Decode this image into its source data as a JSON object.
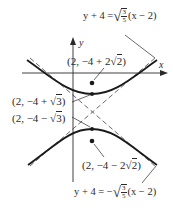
{
  "figure": {
    "type": "hyperbola-graph",
    "axes": {
      "x_label": "x",
      "y_label": "y"
    },
    "equations": {
      "upper_asymptote": {
        "lhs": "y + 4 = ",
        "sqrt": "√",
        "num": "3",
        "den": "5",
        "rhs": "(x − 2)"
      },
      "lower_asymptote": {
        "lhs": "y + 4 = −",
        "sqrt": "√",
        "num": "3",
        "den": "5",
        "rhs": "(x − 2)"
      }
    },
    "points": {
      "upper_focus": {
        "prefix": "(2, −4 + 2",
        "radical": "√",
        "radicand": "2",
        "suffix": ")"
      },
      "upper_vertex": {
        "prefix": "(2, −4 + ",
        "radical": "√",
        "radicand": "3",
        "suffix": ")"
      },
      "lower_vertex": {
        "prefix": "(2, −4 − ",
        "radical": "√",
        "radicand": "3",
        "suffix": ")"
      },
      "lower_focus": {
        "prefix": "(2, −4 − 2",
        "radical": "√",
        "radicand": "2",
        "suffix": ")"
      }
    },
    "colors": {
      "ink": "#2a2a2a",
      "background": "#ffffff"
    }
  }
}
